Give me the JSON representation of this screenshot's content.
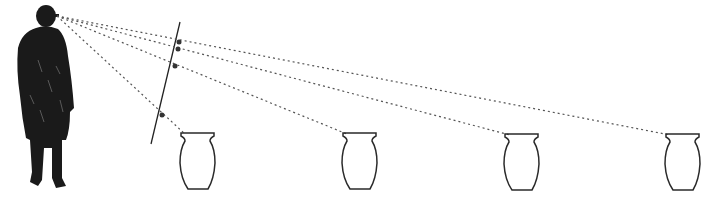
{
  "diagram": {
    "colors": {
      "ink": "#1a1a1a",
      "sightline": "#555555",
      "background": "#ffffff"
    },
    "observer": {
      "eye": [
        57,
        16
      ]
    },
    "picture_plane": {
      "top": [
        180,
        22
      ],
      "bottom": [
        151,
        144
      ]
    },
    "intersections": [
      [
        179,
        42
      ],
      [
        178,
        49
      ],
      [
        175,
        66
      ],
      [
        162,
        115
      ]
    ],
    "vases": [
      {
        "x": 180,
        "top": 133,
        "width": 35,
        "height": 57
      },
      {
        "x": 342,
        "top": 133,
        "width": 35,
        "height": 57
      },
      {
        "x": 504,
        "top": 134,
        "width": 35,
        "height": 57
      },
      {
        "x": 665,
        "top": 134,
        "width": 35,
        "height": 57
      }
    ]
  }
}
